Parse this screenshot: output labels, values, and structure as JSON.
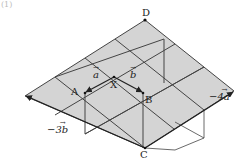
{
  "figure": {
    "number": "(1)",
    "shade_color": "#d4d4d4",
    "line_color": "#444444",
    "points": {
      "D": "D",
      "X": "X",
      "A": "A",
      "B": "B",
      "C": "C"
    },
    "vectors": {
      "a": "a",
      "b": "b",
      "neg4a": "−4a",
      "neg3b": "−3b"
    },
    "vector_arrow": "→"
  }
}
